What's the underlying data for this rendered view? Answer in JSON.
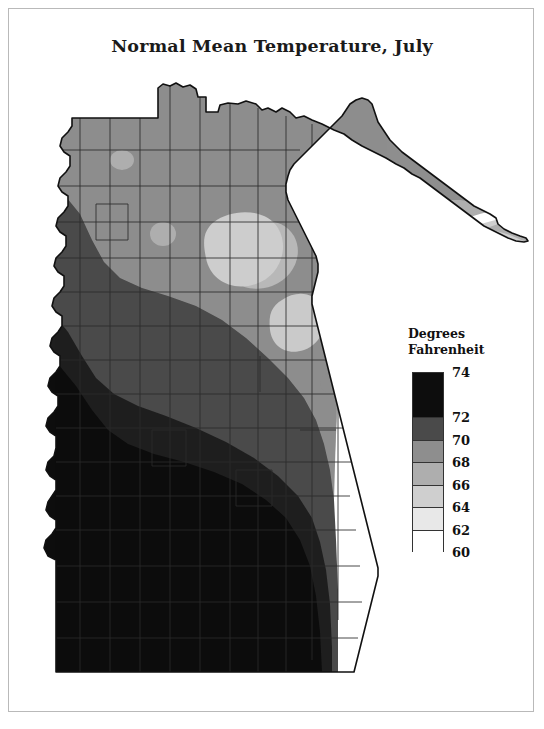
{
  "figure": {
    "title": "Normal Mean Temperature, July",
    "background_color": "#ffffff",
    "frame_color": "#b9b9b9"
  },
  "legend": {
    "title_line1": "Degrees",
    "title_line2": "Fahrenheit",
    "tick_labels": [
      "74",
      "72",
      "70",
      "68",
      "66",
      "64",
      "62",
      "60"
    ],
    "swatch_colors": [
      "#0d0d0d",
      "#4a4a4a",
      "#8e8e8e",
      "#aeaeae",
      "#cfcfcf",
      "#e8e8e8",
      "#ffffff"
    ],
    "band_labels": [
      "72-74",
      "70-72",
      "68-70",
      "66-68",
      "64-66",
      "62-64",
      "60-62"
    ]
  },
  "chart_data": {
    "type": "map",
    "title": "Normal Mean Temperature, July",
    "variable": "Normal mean temperature",
    "month": "July",
    "units": "Degrees Fahrenheit",
    "scale_type": "choropleth-isotherm",
    "legend_title": "Degrees Fahrenheit",
    "legend_ticks": [
      74,
      72,
      70,
      68,
      66,
      64,
      62,
      60
    ],
    "class_breaks": [
      {
        "range": "72-74",
        "low": 72,
        "high": 74,
        "color": "#0d0d0d"
      },
      {
        "range": "70-72",
        "low": 70,
        "high": 72,
        "color": "#1f1f1f"
      },
      {
        "range": "68-70",
        "low": 68,
        "high": 70,
        "color": "#4a4a4a"
      },
      {
        "range": "66-68",
        "low": 66,
        "high": 68,
        "color": "#8e8e8e"
      },
      {
        "range": "64-66",
        "low": 64,
        "high": 66,
        "color": "#aeaeae"
      },
      {
        "range": "62-64",
        "low": 62,
        "high": 64,
        "color": "#cfcfcf"
      },
      {
        "range": "60-62",
        "low": 60,
        "high": 62,
        "color": "#ffffff"
      }
    ],
    "spatial_pattern": {
      "warmest_region": "southern and southwestern Minnesota",
      "warmest_range": "72-74",
      "coolest_region": "northeastern arrowhead along Lake Superior",
      "coolest_range": "60-62",
      "gradient_direction": "temperature decreases from south-southwest toward north-northeast",
      "notes": [
        "Southern half of the state falls in the darkest 72-74 class",
        "A narrow 70-72 band crosses the west-central counties",
        "Central Minnesota is in the 68-70 class",
        "North-central and northern counties are 66-68",
        "Cooler 64-66 pockets occur over northern lake areas",
        "The Lake Superior shore and arrowhead tip reach 60-64"
      ]
    },
    "grid": false,
    "legend_position": "right-center"
  }
}
